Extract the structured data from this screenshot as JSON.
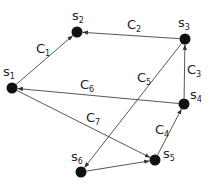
{
  "diagram": {
    "type": "directed-graph",
    "nodes": [
      {
        "id": "S1",
        "base": "s",
        "sub": "1",
        "x": 12,
        "y": 88,
        "lx": 3,
        "ly": 76
      },
      {
        "id": "S2",
        "base": "s",
        "sub": "2",
        "x": 77,
        "y": 32,
        "lx": 72,
        "ly": 20
      },
      {
        "id": "S3",
        "base": "s",
        "sub": "3",
        "x": 185,
        "y": 39,
        "lx": 178,
        "ly": 27
      },
      {
        "id": "S4",
        "base": "s",
        "sub": "4",
        "x": 184,
        "y": 104,
        "lx": 190,
        "ly": 99
      },
      {
        "id": "S5",
        "base": "s",
        "sub": "5",
        "x": 155,
        "y": 160,
        "lx": 163,
        "ly": 158
      },
      {
        "id": "S6",
        "base": "s",
        "sub": "6",
        "x": 81,
        "y": 172,
        "lx": 71,
        "ly": 161
      }
    ],
    "edges": [
      {
        "id": "C1",
        "from": "S1",
        "to": "S2",
        "base": "C",
        "sub": "1",
        "lx": 36,
        "ly": 53
      },
      {
        "id": "C2",
        "from": "S3",
        "to": "S2",
        "base": "C",
        "sub": "2",
        "lx": 127,
        "ly": 29
      },
      {
        "id": "C3",
        "from": "S4",
        "to": "S3",
        "base": "C",
        "sub": "3",
        "lx": 187,
        "ly": 74
      },
      {
        "id": "C4",
        "from": "S5",
        "to": "S4",
        "base": "C",
        "sub": "4",
        "lx": 155,
        "ly": 134
      },
      {
        "id": "C5",
        "from": "S3",
        "to": "S6",
        "base": "C",
        "sub": "5",
        "lx": 137,
        "ly": 82
      },
      {
        "id": "C6",
        "from": "S4",
        "to": "S1",
        "base": "C",
        "sub": "6",
        "lx": 80,
        "ly": 89
      },
      {
        "id": "C7",
        "from": "S1",
        "to": "S5",
        "base": "C",
        "sub": "7",
        "lx": 86,
        "ly": 122
      },
      {
        "id": "",
        "from": "S6",
        "to": "S5",
        "base": "",
        "sub": "",
        "lx": 0,
        "ly": 0
      }
    ]
  }
}
